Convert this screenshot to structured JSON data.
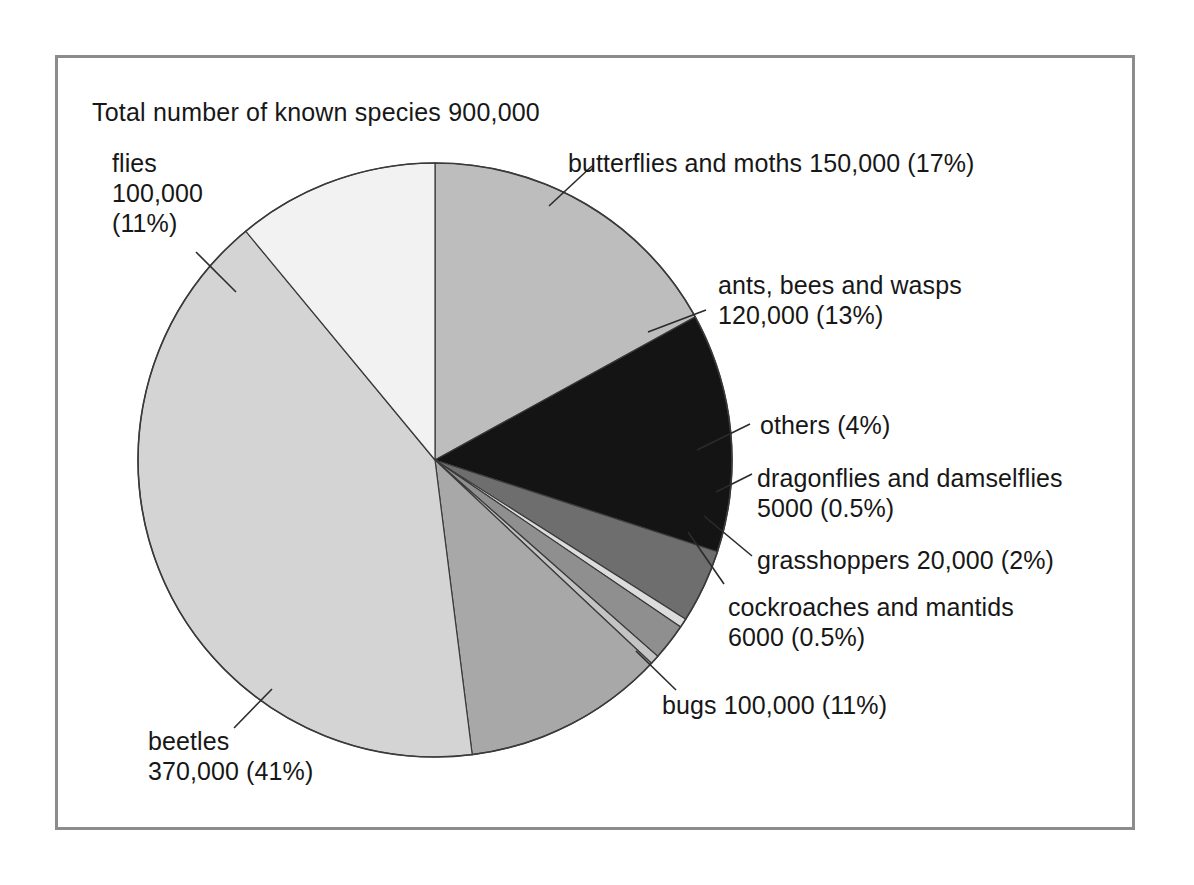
{
  "page": {
    "background_color": "#ffffff",
    "frame_border_color": "#8c8c8c"
  },
  "chart_title": "Total number of known species 900,000",
  "labels": {
    "flies": {
      "line1": "flies",
      "line2": "100,000",
      "line3": "(11%)"
    },
    "butterflies": {
      "line1": "butterflies and moths 150,000 (17%)"
    },
    "ants": {
      "line1": "ants, bees and wasps",
      "line2": "120,000 (13%)"
    },
    "others": {
      "line1": "others (4%)"
    },
    "dragonflies": {
      "line1": "dragonflies and damselflies",
      "line2": "5000 (0.5%)"
    },
    "grasshoppers": {
      "line1": "grasshoppers 20,000 (2%)"
    },
    "cockroaches": {
      "line1": "cockroaches and mantids",
      "line2": "6000 (0.5%)"
    },
    "bugs": {
      "line1": "bugs 100,000 (11%)"
    },
    "beetles": {
      "line1": "beetles",
      "line2": "370,000 (41%)"
    }
  },
  "chart_data": {
    "type": "pie",
    "title": "Total number of known species 900,000",
    "total": 900000,
    "total_label": "900,000",
    "units": "known species",
    "start_angle_deg": 0,
    "direction": "clockwise",
    "legend": "none (direct labels with leader lines)",
    "grid": false,
    "slices": [
      {
        "name": "butterflies and moths",
        "value": 150000,
        "value_label": "150,000",
        "percent": 17,
        "percent_label": "17%",
        "color": "#bdbdbd",
        "label_text": "butterflies and moths 150,000 (17%)"
      },
      {
        "name": "ants, bees and wasps",
        "value": 120000,
        "value_label": "120,000",
        "percent": 13,
        "percent_label": "13%",
        "color": "#141414",
        "label_text": "ants, bees and wasps 120,000 (13%)"
      },
      {
        "name": "others",
        "value": null,
        "value_label": "",
        "percent": 4,
        "percent_label": "4%",
        "color": "#6e6e6e",
        "label_text": "others (4%)"
      },
      {
        "name": "dragonflies and damselflies",
        "value": 5000,
        "value_label": "5000",
        "percent": 0.5,
        "percent_label": "0.5%",
        "color": "#dcdcdc",
        "label_text": "dragonflies and damselflies 5000 (0.5%)"
      },
      {
        "name": "grasshoppers",
        "value": 20000,
        "value_label": "20,000",
        "percent": 2,
        "percent_label": "2%",
        "color": "#8f8f8f",
        "label_text": "grasshoppers 20,000 (2%)"
      },
      {
        "name": "cockroaches and mantids",
        "value": 6000,
        "value_label": "6000",
        "percent": 0.5,
        "percent_label": "0.5%",
        "color": "#c4c4c4",
        "label_text": "cockroaches and mantids 6000 (0.5%)"
      },
      {
        "name": "bugs",
        "value": 100000,
        "value_label": "100,000",
        "percent": 11,
        "percent_label": "11%",
        "color": "#a8a8a8",
        "label_text": "bugs 100,000 (11%)"
      },
      {
        "name": "beetles",
        "value": 370000,
        "value_label": "370,000",
        "percent": 41,
        "percent_label": "41%",
        "color": "#d4d4d4",
        "label_text": "beetles 370,000 (41%)"
      },
      {
        "name": "flies",
        "value": 100000,
        "value_label": "100,000",
        "percent": 11,
        "percent_label": "11%",
        "color": "#f2f2f2",
        "label_text": "flies 100,000 (11%)"
      }
    ]
  },
  "geometry": {
    "center_x": 435,
    "center_y": 460,
    "radius": 297,
    "outline_color": "#3a3a3a",
    "leader_line_color": "#2b2b2b"
  }
}
